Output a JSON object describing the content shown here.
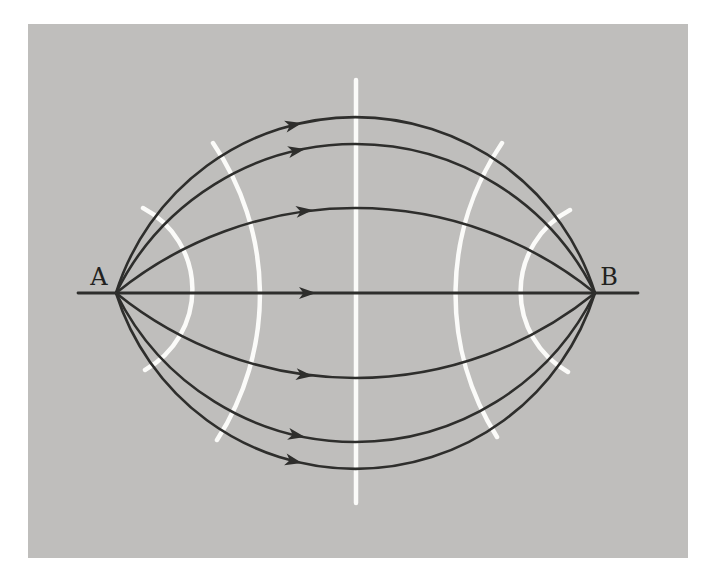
{
  "figure": {
    "labels": {
      "a": "A",
      "b": "B"
    },
    "colors": {
      "page_bg": "#ffffff",
      "panel_bg": "#bfbebc",
      "panel_dot": "#aaa9a6",
      "path_stroke": "#2e2e2c",
      "wavefront_stroke": "#fbfbf9",
      "label_color": "#222220"
    },
    "panel": {
      "left": 28,
      "top": 24,
      "width": 660,
      "height": 534
    },
    "points": {
      "a": {
        "x": 88,
        "y": 269
      },
      "b": {
        "x": 567,
        "y": 269
      }
    },
    "label_positions": {
      "a": {
        "x": 71,
        "y": 261
      },
      "b": {
        "x": 581,
        "y": 261
      }
    },
    "baseline": {
      "x1": 50,
      "y1": 269,
      "x2": 610,
      "y2": 269
    },
    "center_line": {
      "x": 328,
      "y1": 56,
      "y2": 479
    },
    "field_lines": [
      {
        "name": "path-top-outer",
        "radius": 251,
        "sweep": 1,
        "arrow": {
          "x": 274,
          "y": 99,
          "angle": -12.3
        }
      },
      {
        "name": "path-top-middle",
        "radius": 267,
        "sweep": 1,
        "arrow": {
          "x": 277,
          "y": 125,
          "angle": -10.9
        }
      },
      {
        "name": "path-top-inner",
        "radius": 380,
        "sweep": 1,
        "arrow": {
          "x": 285,
          "y": 186,
          "angle": -6.4
        }
      },
      {
        "name": "path-straight",
        "radius": null,
        "arrow": {
          "x": 288,
          "y": 269,
          "angle": 0
        }
      },
      {
        "name": "path-bottom-inner",
        "radius": 380,
        "sweep": 0,
        "arrow": {
          "x": 285,
          "y": 352,
          "angle": 6.4
        }
      },
      {
        "name": "path-bottom-middle",
        "radius": 267,
        "sweep": 0,
        "arrow": {
          "x": 277,
          "y": 413,
          "angle": 10.9
        }
      },
      {
        "name": "path-bottom-outer",
        "radius": 251,
        "sweep": 0,
        "arrow": {
          "x": 274,
          "y": 439,
          "angle": 12.3
        }
      }
    ],
    "wavefronts": [
      {
        "name": "wavefront-a-inner",
        "x1": 115,
        "y1": 184,
        "x2": 117,
        "y2": 346,
        "radius": 92,
        "sweep": 1
      },
      {
        "name": "wavefront-a-outer",
        "x1": 185,
        "y1": 119,
        "x2": 189,
        "y2": 416,
        "radius": 268,
        "sweep": 1
      },
      {
        "name": "wavefront-b-outer",
        "x1": 474,
        "y1": 119,
        "x2": 469,
        "y2": 413,
        "radius": 268,
        "sweep": 0
      },
      {
        "name": "wavefront-b-inner",
        "x1": 542,
        "y1": 186,
        "x2": 540,
        "y2": 348,
        "radius": 92,
        "sweep": 0
      }
    ],
    "arrowhead": {
      "points": "0,0 -17,-6 -12.5,0 -17,6"
    },
    "stroke_widths": {
      "path": 2.6,
      "baseline": 2.8,
      "wavefront": 4.5
    }
  }
}
